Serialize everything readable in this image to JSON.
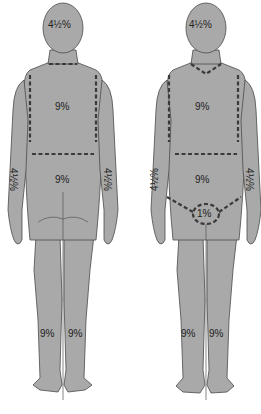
{
  "diagram": {
    "colors": {
      "body": "#a9a9a9",
      "outline": "#4a4a4a",
      "dash": "#3a3a3a",
      "background": "#ffffff"
    },
    "back_view": {
      "head": "4½%",
      "upper_trunk": "9%",
      "lower_trunk": "9%",
      "left_arm": "4½%",
      "right_arm": "4½%",
      "left_leg": "9%",
      "right_leg": "9%"
    },
    "front_view": {
      "head": "4½%",
      "upper_trunk": "9%",
      "lower_trunk": "9%",
      "left_arm": "4½%",
      "right_arm": "4½%",
      "perineum": "1%",
      "left_leg": "9%",
      "right_leg": "9%"
    }
  }
}
